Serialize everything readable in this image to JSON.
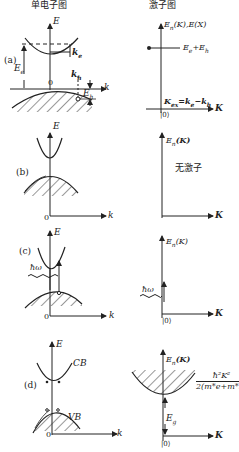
{
  "columns": {
    "left_title": "单电子图",
    "right_title": "激子图"
  },
  "panels": [
    {
      "id": "a",
      "label": "(a)",
      "left": {
        "y_axis": "E",
        "x_axis": "k",
        "origin": "0",
        "labels": [
          "E_e",
          "k_e",
          "k_h",
          "E_h"
        ]
      },
      "right": {
        "y_axis": "E_n(K), E(X)",
        "x_axis": "K",
        "origin": "|0⟩",
        "level_label": "E_e+E_h",
        "momentum_label": "K_ex=k_e−k_h"
      }
    },
    {
      "id": "b",
      "label": "(b)",
      "left": {
        "y_axis": "E",
        "x_axis": "k",
        "origin": "0"
      },
      "right": {
        "y_axis": "E_n(K)",
        "x_axis": "K",
        "origin": "|0⟩",
        "note": "无激子"
      }
    },
    {
      "id": "c",
      "label": "(c)",
      "left": {
        "y_axis": "E",
        "x_axis": "k",
        "origin": "0",
        "photon": "ħω"
      },
      "right": {
        "y_axis": "E_n(K)",
        "x_axis": "K",
        "origin": "|0⟩",
        "photon": "ħω"
      }
    },
    {
      "id": "d",
      "label": "(d)",
      "left": {
        "y_axis": "E",
        "x_axis": "k",
        "origin": "0",
        "conduction_band": "CB",
        "valence_band": "VB"
      },
      "right": {
        "y_axis": "E_n(K)",
        "x_axis": "K",
        "origin": "|0⟩",
        "gap_label": "E_g",
        "dispersion_numerator": "ħ²K²",
        "dispersion_denominator": "2(m*e+m*h)"
      }
    }
  ],
  "text": {
    "col_left": "单电子图",
    "col_right": "激子图",
    "a_label": "(a)",
    "b_label": "(b)",
    "c_label": "(c)",
    "d_label": "(d)",
    "E": "E",
    "k": "k",
    "K": "K",
    "zero": "0",
    "ket0": "|0⟩",
    "Ee": "E",
    "Ee_sub": "e",
    "ke": "k",
    "ke_sub": "e",
    "kh": "k",
    "kh_sub": "h",
    "Eh": "E",
    "Eh_sub": "h",
    "a_right_axis": "E",
    "a_right_axis_rest": "(K),E(X)",
    "n_sub": "n",
    "a_level": "E",
    "a_level_rest": "+E",
    "Kex": "K",
    "Kex_sub": "ex",
    "Kex_rest": "=k",
    "Kex_minus": "−k",
    "En": "E",
    "EnK": "(K)",
    "no_exciton": "无激子",
    "hw": "ħω",
    "CB": "CB",
    "VB": "VB",
    "Eg": "E",
    "Eg_sub": "g",
    "disp_num": "ħ²K²",
    "disp_den": "2(m*e+m*h)"
  }
}
